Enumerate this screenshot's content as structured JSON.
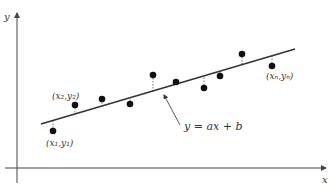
{
  "diagram": {
    "axes": {
      "x_label": "x",
      "y_label": "y",
      "x_axis_y": 168,
      "x_axis_from": 5,
      "x_axis_to": 326,
      "y_axis_x": 17,
      "y_axis_from": 183,
      "y_axis_to": 13
    },
    "regression_line": {
      "x1": 41,
      "y1": 124,
      "x2": 295,
      "y2": 49,
      "equation_label": "y = ax + b"
    },
    "annotation_arrow": {
      "from_x": 180,
      "from_y": 125,
      "to_x": 164,
      "to_y": 95
    },
    "points": [
      {
        "x": 53,
        "y": 131
      },
      {
        "x": 75,
        "y": 105
      },
      {
        "x": 102,
        "y": 99
      },
      {
        "x": 130,
        "y": 104
      },
      {
        "x": 153,
        "y": 75
      },
      {
        "x": 176,
        "y": 82
      },
      {
        "x": 204,
        "y": 88
      },
      {
        "x": 220,
        "y": 76
      },
      {
        "x": 242,
        "y": 54
      },
      {
        "x": 272,
        "y": 66
      }
    ],
    "point_labels": {
      "p1": "(x₁,y₁)",
      "p2": "(x₂,y₂)",
      "pn": "(xₙ,yₙ)"
    },
    "colors": {
      "axis": "#444444",
      "line": "#333333",
      "point": "#111111",
      "residual": "#555555",
      "text": "#333333"
    }
  }
}
